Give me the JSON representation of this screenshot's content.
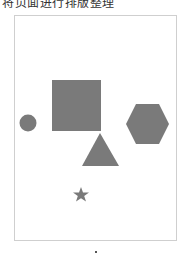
{
  "header": {
    "title": "将页面进行排版整理"
  },
  "canvas": {
    "fill_color": "#7a7a7a",
    "shapes": [
      {
        "type": "circle",
        "name": "circle",
        "cx": 28,
        "cy": 123,
        "r": 8.5
      },
      {
        "type": "square",
        "name": "square",
        "x": 52,
        "y": 80,
        "w": 49,
        "h": 51
      },
      {
        "type": "triangle",
        "name": "triangle",
        "points": "100,133 82,166 119,166"
      },
      {
        "type": "hexagon",
        "name": "hexagon",
        "points": "136,104 159,104 169,124 159,144 136,144 126,124"
      },
      {
        "type": "star",
        "name": "star",
        "cx": 81,
        "cy": 195
      }
    ]
  },
  "pagination": {
    "indicator": "•"
  }
}
